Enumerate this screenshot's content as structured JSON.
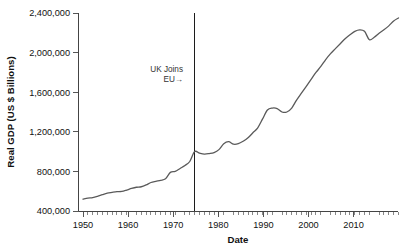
{
  "chart_data": {
    "type": "line",
    "title": "",
    "xlabel": "Date",
    "ylabel": "Real GDP (US $ Billions)",
    "xlim": [
      1950,
      2015
    ],
    "ylim": [
      400000,
      2400000
    ],
    "grid": false,
    "legend": null,
    "y_ticks": [
      400000,
      800000,
      1200000,
      1600000,
      2000000,
      2400000
    ],
    "y_tick_labels": [
      "400,000",
      "800,000",
      "1,200,000",
      "1,600,000",
      "2,000,000",
      "2,400,000"
    ],
    "x_ticks": [
      1950,
      1960,
      1970,
      1980,
      1990,
      2000,
      2010
    ],
    "x_tick_labels": [
      "1950",
      "1960",
      "1970",
      "1980",
      "1990",
      "2000",
      "2010"
    ],
    "x_minor_tick_interval": 1,
    "line_color": "#5a5a5a",
    "annotations": [
      {
        "label_line1": "UK Joins",
        "label_line2": "EU→",
        "x": 1973,
        "type": "vertical-reference-line",
        "line_color": "#1c1c1c"
      }
    ],
    "series": [
      {
        "name": "Real GDP (US $ Billions)",
        "x": [
          1950,
          1951,
          1952,
          1953,
          1954,
          1955,
          1956,
          1957,
          1958,
          1959,
          1960,
          1961,
          1962,
          1963,
          1964,
          1965,
          1966,
          1967,
          1968,
          1969,
          1970,
          1971,
          1972,
          1973,
          1974,
          1975,
          1976,
          1977,
          1978,
          1979,
          1980,
          1981,
          1982,
          1983,
          1984,
          1985,
          1986,
          1987,
          1988,
          1989,
          1990,
          1991,
          1992,
          1993,
          1994,
          1995,
          1996,
          1997,
          1998,
          1999,
          2000,
          2001,
          2002,
          2003,
          2004,
          2005,
          2006,
          2007,
          2008,
          2009,
          2010,
          2011,
          2012,
          2013,
          2014,
          2015
        ],
        "values": [
          520000,
          530000,
          535000,
          548000,
          565000,
          580000,
          588000,
          595000,
          598000,
          612000,
          628000,
          640000,
          645000,
          663000,
          688000,
          700000,
          710000,
          725000,
          790000,
          800000,
          830000,
          860000,
          900000,
          1000000,
          985000,
          975000,
          980000,
          990000,
          1020000,
          1080000,
          1100000,
          1075000,
          1080000,
          1105000,
          1140000,
          1190000,
          1240000,
          1330000,
          1420000,
          1440000,
          1435000,
          1400000,
          1400000,
          1440000,
          1520000,
          1590000,
          1660000,
          1730000,
          1800000,
          1860000,
          1930000,
          1990000,
          2040000,
          2090000,
          2140000,
          2180000,
          2215000,
          2230000,
          2215000,
          2130000,
          2155000,
          2195000,
          2230000,
          2270000,
          2320000,
          2350000
        ]
      }
    ]
  }
}
